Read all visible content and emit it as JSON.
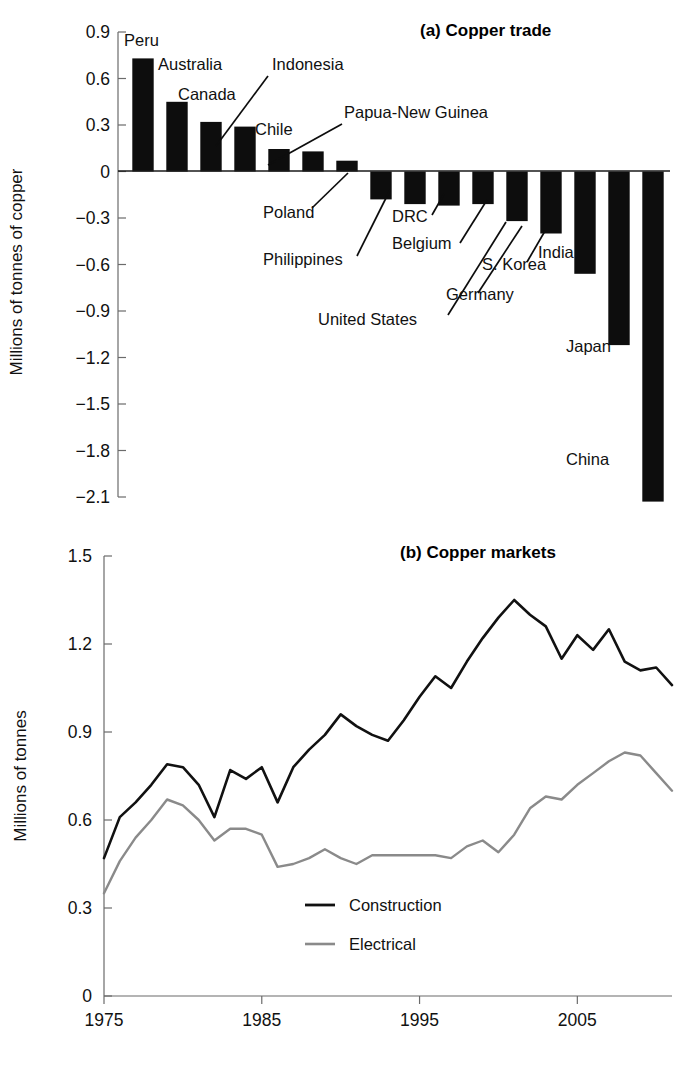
{
  "figure": {
    "panel_a_label": "(a)",
    "panel_b_label": "(b)"
  },
  "chart_data": [
    {
      "type": "bar",
      "title": "(a) Copper  trade",
      "xlabel": "",
      "ylabel": "Millions of tonnes of copper",
      "ylim": [
        -2.25,
        0.9
      ],
      "yticks": [
        "0.9",
        "0.6",
        "0.3",
        "0",
        "−0.3",
        "−0.6",
        "−0.9",
        "−1.2",
        "−1.5",
        "−1.8",
        "−2.1"
      ],
      "ytick_values": [
        0.9,
        0.6,
        0.3,
        0,
        -0.3,
        -0.6,
        -0.9,
        -1.2,
        -1.5,
        -1.8,
        -2.1
      ],
      "grid": false,
      "categories": [
        "Peru",
        "Australia",
        "Canada",
        "Indonesia",
        "Chile",
        "Papua-New Guinea",
        "Poland",
        "Philippines",
        "DRC",
        "Belgium",
        "United States",
        "Germany",
        "S. Korea",
        "India",
        "Japan",
        "China"
      ],
      "values": [
        0.73,
        0.45,
        0.32,
        0.29,
        0.145,
        0.13,
        0.07,
        -0.18,
        -0.21,
        -0.22,
        -0.21,
        -0.32,
        -0.4,
        -0.66,
        -1.12,
        -2.13
      ],
      "labels": [
        {
          "text": "Peru",
          "kind": "direct"
        },
        {
          "text": "Australia",
          "kind": "direct"
        },
        {
          "text": "Canada",
          "kind": "direct"
        },
        {
          "text": "Indonesia",
          "kind": "leader"
        },
        {
          "text": "Chile",
          "kind": "direct"
        },
        {
          "text": "Papua-New Guinea",
          "kind": "leader"
        },
        {
          "text": "Poland",
          "kind": "leader"
        },
        {
          "text": "Philippines",
          "kind": "leader"
        },
        {
          "text": "DRC",
          "kind": "leader"
        },
        {
          "text": "Belgium",
          "kind": "leader"
        },
        {
          "text": "United States",
          "kind": "leader"
        },
        {
          "text": "Germany",
          "kind": "leader"
        },
        {
          "text": "S. Korea",
          "kind": "leader"
        },
        {
          "text": "India",
          "kind": "direct"
        },
        {
          "text": "Japan",
          "kind": "direct"
        },
        {
          "text": "China",
          "kind": "direct"
        }
      ],
      "colors": {
        "bar": "#0d0d0d"
      }
    },
    {
      "type": "line",
      "title": "(b) Copper markets",
      "xlabel": "",
      "ylabel": "Millions of tonnes",
      "ylim": [
        0,
        1.5
      ],
      "yticks": [
        "1.5",
        "1.2",
        "0.9",
        "0.6",
        "0.3",
        "0"
      ],
      "ytick_values": [
        1.5,
        1.2,
        0.9,
        0.6,
        0.3,
        0
      ],
      "xlim": [
        1975,
        2011
      ],
      "xticks": [
        "1975",
        "1985",
        "1995",
        "2005"
      ],
      "xtick_values": [
        1975,
        1985,
        1995,
        2005
      ],
      "grid": false,
      "legend_position": "bottom-center",
      "x": [
        1975,
        1976,
        1977,
        1978,
        1979,
        1980,
        1981,
        1982,
        1983,
        1984,
        1985,
        1986,
        1987,
        1988,
        1989,
        1990,
        1991,
        1992,
        1993,
        1994,
        1995,
        1996,
        1997,
        1998,
        1999,
        2000,
        2001,
        2002,
        2003,
        2004,
        2005,
        2006,
        2007,
        2008,
        2009,
        2010,
        2011
      ],
      "series": [
        {
          "name": "Construction",
          "color": "#111111",
          "values": [
            0.47,
            0.61,
            0.66,
            0.72,
            0.79,
            0.78,
            0.72,
            0.61,
            0.77,
            0.74,
            0.78,
            0.66,
            0.78,
            0.84,
            0.89,
            0.96,
            0.92,
            0.89,
            0.87,
            0.94,
            1.02,
            1.09,
            1.05,
            1.14,
            1.22,
            1.29,
            1.35,
            1.3,
            1.26,
            1.15,
            1.23,
            1.18,
            1.25,
            1.14,
            1.11,
            1.12,
            1.06
          ]
        },
        {
          "name": "Electrical",
          "color": "#8a8a8a",
          "values": [
            0.35,
            0.46,
            0.54,
            0.6,
            0.67,
            0.65,
            0.6,
            0.53,
            0.57,
            0.57,
            0.55,
            0.44,
            0.45,
            0.47,
            0.5,
            0.47,
            0.45,
            0.48,
            0.48,
            0.48,
            0.48,
            0.48,
            0.47,
            0.51,
            0.53,
            0.49,
            0.55,
            0.64,
            0.68,
            0.67,
            0.72,
            0.76,
            0.8,
            0.83,
            0.82,
            0.76,
            0.7
          ]
        }
      ],
      "legend": [
        {
          "label": "Construction",
          "color": "#111111"
        },
        {
          "label": "Electrical",
          "color": "#8a8a8a"
        }
      ]
    }
  ]
}
